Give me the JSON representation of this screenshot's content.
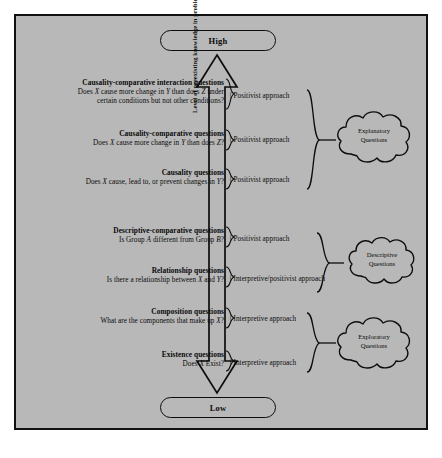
{
  "figure": {
    "scale_top_label": "High",
    "scale_bottom_label": "Low",
    "axis_label": "Level of preexisting knowledge in problem area"
  },
  "questions": [
    {
      "title": "Causality-comparative interaction questions",
      "example_a": "Does X cause more change in Y than does Z under",
      "example_b": "certain conditions but not other conditions?"
    },
    {
      "title": "Causality-comparative questions",
      "example_a": "Does X cause more change in Y than does Z?",
      "example_b": ""
    },
    {
      "title": "Causality questions",
      "example_a": "Does X cause, lead to, or prevent changes in Y?",
      "example_b": ""
    },
    {
      "title": "Descriptive-comparative questions",
      "example_a": "Is Group A different from Group B?",
      "example_b": ""
    },
    {
      "title": "Relationship questions",
      "example_a": "Is there a relationship between X and Y?",
      "example_b": ""
    },
    {
      "title": "Composition questions",
      "example_a": "What are the components that make up X?",
      "example_b": ""
    },
    {
      "title": "Existence questions",
      "example_a": "Does X Exist?",
      "example_b": ""
    }
  ],
  "approaches": [
    {
      "label": "Positivist approach"
    },
    {
      "label": "Positivist approach"
    },
    {
      "label": "Positivist approach"
    },
    {
      "label": "Positivist approach"
    },
    {
      "label": "Interpretive/positivist approach"
    },
    {
      "label": "Interpretive approach"
    },
    {
      "label": "Interpretive approach"
    }
  ],
  "clouds": [
    {
      "line1": "Explanatory",
      "line2": "Questions"
    },
    {
      "line1": "Descriptive",
      "line2": "Questions"
    },
    {
      "line1": "Exploratory",
      "line2": "Questions"
    }
  ],
  "colors": {
    "background": "#b8b8b8",
    "ink": "#0d0d0d",
    "page": "#ffffff"
  }
}
